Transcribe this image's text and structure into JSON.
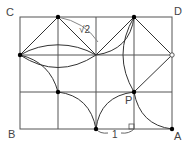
{
  "diagram": {
    "labels": {
      "C": "C",
      "D": "D",
      "B": "B",
      "A": "A",
      "P": "P",
      "length_one": "1",
      "length_sqrt2": "√2"
    },
    "grid": {
      "columns": 4,
      "rows": 3
    },
    "colors": {
      "line": "#333333",
      "point": "#000000",
      "background": "#ffffff"
    }
  }
}
